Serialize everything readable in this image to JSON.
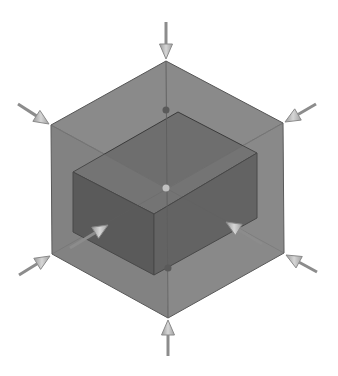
{
  "figure": {
    "title": "Isometric bounding box with inner block and inward arrows",
    "colors": {
      "background": "#ffffff",
      "outer_top": "#8a8a8a",
      "outer_left": "#7e7e7e",
      "outer_right": "#868686",
      "outer_edge": "#555555",
      "inner_top": "#6e6e6e",
      "inner_left": "#4f4f4f",
      "inner_right": "#5a5a5a",
      "inner_edge": "#3a3a3a",
      "arrow_shaft": "#8c8c8c",
      "arrow_head": "#c8c8c8",
      "arrow_head_dark": "#9a9a9a"
    },
    "outer_hexagon": {
      "top": [
        166,
        61
      ],
      "upper_right": [
        283,
        123
      ],
      "lower_right": [
        284,
        253
      ],
      "bottom": [
        168,
        318
      ],
      "lower_left": [
        52,
        254
      ],
      "upper_left": [
        51,
        125
      ],
      "center": [
        167,
        188
      ]
    },
    "inner_box": {
      "top_face": [
        [
          73,
          172
        ],
        [
          178,
          112
        ],
        [
          257,
          153
        ],
        [
          154,
          214
        ]
      ],
      "left_face": [
        [
          73,
          172
        ],
        [
          154,
          214
        ],
        [
          154,
          275
        ],
        [
          73,
          232
        ]
      ],
      "right_face": [
        [
          154,
          214
        ],
        [
          257,
          153
        ],
        [
          257,
          218
        ],
        [
          154,
          275
        ]
      ]
    },
    "arrows": [
      {
        "name": "arrow-top",
        "from": [
          166,
          22
        ],
        "to": [
          166,
          59
        ]
      },
      {
        "name": "arrow-upper-left",
        "from": [
          18,
          104
        ],
        "to": [
          49,
          124
        ]
      },
      {
        "name": "arrow-upper-right",
        "from": [
          316,
          104
        ],
        "to": [
          285,
          122
        ]
      },
      {
        "name": "arrow-lower-left",
        "from": [
          19,
          275
        ],
        "to": [
          50,
          256
        ]
      },
      {
        "name": "arrow-lower-right",
        "from": [
          317,
          272
        ],
        "to": [
          286,
          255
        ]
      },
      {
        "name": "arrow-bottom",
        "from": [
          168,
          356
        ],
        "to": [
          168,
          320
        ]
      },
      {
        "name": "arrow-inner-left",
        "from": [
          70,
          248
        ],
        "to": [
          108,
          225
        ]
      },
      {
        "name": "arrow-inner-right",
        "from": [
          262,
          244
        ],
        "to": [
          226,
          222
        ]
      }
    ]
  }
}
